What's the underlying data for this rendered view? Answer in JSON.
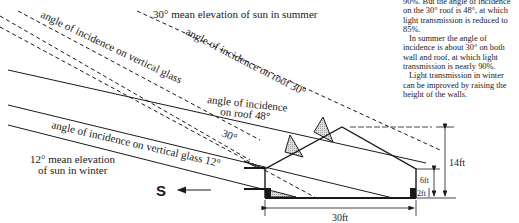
{
  "side_text": {
    "paragraphs": [
      "90%. But the angle of incidence on the 30° roof is 48°, at which light transmission is reduced to 85%.",
      "In summer the angle of incidence is about 30° on both wall and roof, at which light transmission is nearly 90%.",
      "Light transmission in winter can be improved by raising the height of the walls."
    ]
  },
  "labels": {
    "summer_elevation": "30° mean elevation of sun in summer",
    "summer_vertical_glass": "angle of incidence on vertical glass",
    "summer_roof": "angle of incidence on roof 30°",
    "winter_roof_line1": "angle of incidence",
    "winter_roof_line2": "on roof 48°",
    "angle_30": "30°",
    "winter_vertical_glass": "angle of incidence on vertical glass 12°",
    "winter_elevation_line1": "12° mean elevation",
    "winter_elevation_line2": "of sun in winter",
    "south": "S"
  },
  "dimensions": {
    "height_total": "14ft",
    "wall_height": "6ft",
    "base_height": "2ft",
    "width": "30ft"
  },
  "colors": {
    "line": "#1a1a1a",
    "shade": "#bdbdbd"
  }
}
